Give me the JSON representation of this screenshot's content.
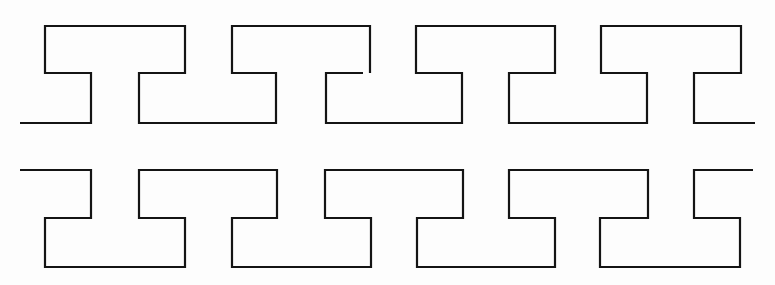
{
  "figure": {
    "background_color": "#ffffff",
    "stroke_color": "#141414",
    "rows": [
      {
        "id": "top-row",
        "levels": {
          "top": 26,
          "middle": 73,
          "bottom": 123
        },
        "paths": [
          "M20,123 L91,123 L91,73 L45,73 L45,26 L185,26 L185,73 L139,73 L139,123 L276,123 L276,73 L232,73 L232,26 L370,26 L370,73",
          "M363,73 L326,73 L326,123 L462,123 L462,73 L416,73 L416,26 L555,26 L555,73 L509,73 L509,123 L647,123 L647,73 L601,73 L601,26 L741,26 L741,73 L694,73 L694,123 L755,123"
        ]
      },
      {
        "id": "bottom-row",
        "levels": {
          "top": 170,
          "middle": 218,
          "bottom": 267
        },
        "paths": [
          "M20,170 L91,170 L91,218 L45,218 L45,267 L185,267 L185,218 L139,218 L139,170 L277,170 L277,218 L232,218 L232,267 L371,267 L371,218 L325,218 L325,170 L463,170 L463,218 L417,218 L417,267 L555,267 L555,218 L509,218 L509,170 L648,170 L648,218 L600,218 L600,267 L740,267 L740,218 L694,218 L694,170 L753,170"
        ]
      }
    ]
  }
}
